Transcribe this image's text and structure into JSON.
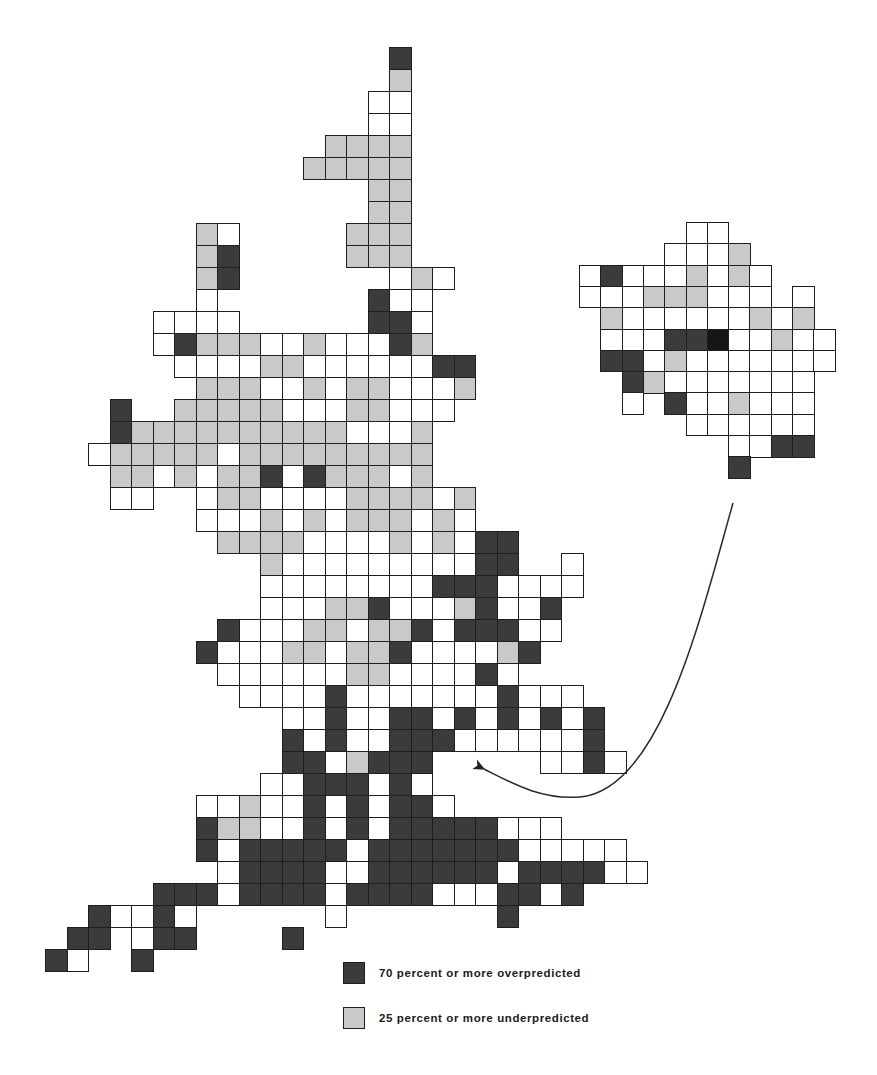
{
  "figure": {
    "type": "grid-cell thematic map",
    "main_map": {
      "region": "Great Britain",
      "origin_x": 45,
      "origin_y": 47,
      "cell_w": 21.5,
      "cell_h": 22,
      "col_offset": -2,
      "legend_codes": {
        ".": "no cell",
        "w": "other",
        "g": "25 percent or more underpredicted",
        "d": "70 percent or more overpredicted"
      },
      "rows": [
        "................d...........",
        "................g...........",
        "...............ww...........",
        "...............ww...........",
        ".............gggg...........",
        "............ggggg...........",
        "...............gg...........",
        "...............gg...........",
        ".......gw.....ggg...........",
        ".......gd.....ggg...........",
        ".......gd.......wgw.........",
        ".......w.......dww..........",
        ".....wwww......ddw..........",
        ".....wdgggwwgwwwdg..........",
        "......wwwwggwwwwwwdd........",
        ".......gggwwgwggwwwg........",
        "...d..gggggwwwggw.w.........",
        "...dggggggggggwwwg..........",
        "..wgggggwggggggggg..........",
        "...ggwgwggdwdgggwg..........",
        "...ww..wggwwwwggggwg........",
        ".......wwwgwgwgggwgw........",
        "........ggggwwwwgwgwdd......",
        "..........gwwwwwwwwwdd..w...",
        "..........wwwwwwwwdddwwww...",
        "..........wwwggdwwwgdwwd....",
        "........dwwwggwggdwdddww....",
        ".......dwwwggwggdwwwwgd.....",
        "........wwwwwwggwwwwdw......",
        ".........wwwwdwwwwwwwdwww...",
        "...........wwdwwddwdwdwdwd..",
        "...........dwdwwdddwwwwwwd..",
        "...........ddwgddd.....wwdw.",
        "..........wwdddwdw..........",
        ".......wwgwwdwdwddw.........",
        ".......dggwwdwdwdddddwww....",
        ".......dwdddddwdddddddwwwww.",
        "........wddddwwddddddwddddww",
        ".....dddwddddwddddwwwddwd...",
        "..dwwdw......w.......d......",
        ".dd.wdd....d................",
        "dw..d......................."
      ]
    },
    "inset_map": {
      "region": "London (enlarged)",
      "origin_x": 579,
      "origin_y": 222,
      "cell_w": 21.3,
      "cell_h": 21.3,
      "rows": [
        ".....ww.....",
        "....wwwg....",
        "wdwwwgwgw...",
        "wwwgggwww.w.",
        ".gwwwwwwgwg.",
        ".wwwddbwwgww",
        ".ddwgwwwwwww",
        "..dgwwwwwww.",
        "..w.dwwgwww.",
        ".....wwwwww.",
        ".......wwdd.",
        ".......d...."
      ]
    },
    "arrow": {
      "from": "inset_map",
      "to": "London location on main map",
      "path": "M 733 503 C 700 620, 660 790, 580 797 C 540 800, 510 782, 484 769"
    },
    "colors": {
      "overpredicted": "#3b3b3b",
      "underpredicted": "#c9c9c9",
      "neutral": "#ffffff",
      "outline": "#1e1e1e"
    },
    "legend": [
      {
        "key": "d",
        "label": "70 percent or more overpredicted"
      },
      {
        "key": "g",
        "label": "25 percent or more underpredicted"
      }
    ]
  }
}
